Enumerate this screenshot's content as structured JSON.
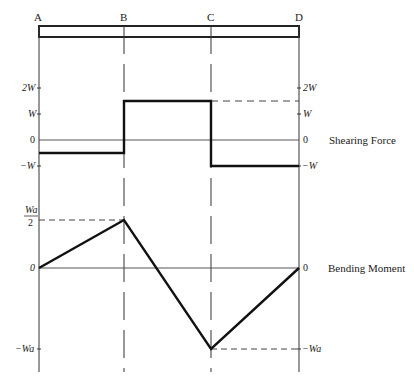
{
  "diagram": {
    "type": "shear-force-bending-moment-diagram",
    "points": [
      "A",
      "B",
      "C",
      "D"
    ],
    "beam_label": "beam",
    "shear_force": {
      "title": "Shearing Force",
      "ticks_left": [
        "2W",
        "W",
        "0",
        "−W"
      ],
      "ticks_right": [
        "2W",
        "W",
        "0",
        "−W"
      ],
      "tick_values": [
        2,
        1,
        0,
        -1
      ],
      "segments": [
        {
          "from": "A",
          "to": "B",
          "value": -0.5
        },
        {
          "from": "B",
          "to": "C",
          "value": 1.5
        },
        {
          "from": "C",
          "to": "D",
          "value": -1
        }
      ]
    },
    "bending_moment": {
      "title": "Bending Moment",
      "tick_top_num": "Wa",
      "tick_top_den": "2",
      "tick_zero_left": "0",
      "tick_zero_right": "0",
      "tick_bottom_left": "−Wa",
      "tick_bottom_right": "−Wa",
      "values": [
        {
          "at": "A",
          "value": 0
        },
        {
          "at": "B",
          "value": 0.5
        },
        {
          "at": "C",
          "value": -1
        },
        {
          "at": "D",
          "value": 0
        }
      ]
    }
  }
}
